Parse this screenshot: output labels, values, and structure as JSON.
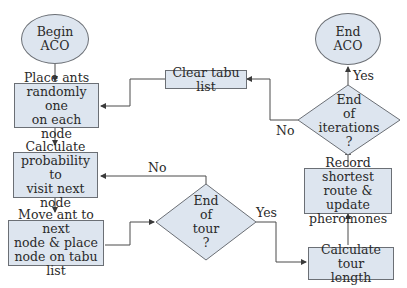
{
  "nodes": {
    "begin": {
      "line1": "Begin",
      "line2": "ACO"
    },
    "place_ants": {
      "line1": "Place ants",
      "line2": "randomly one",
      "line3": "on each node"
    },
    "calc_prob": {
      "line1": "Calculate",
      "line2": "probability to",
      "line3": "visit next node"
    },
    "move_ant": {
      "line1": "Move ant to next",
      "line2": "node & place",
      "line3": "node on tabu list"
    },
    "end_tour": {
      "line1": "End",
      "line2": "of",
      "line3": "tour",
      "line4": "?"
    },
    "calc_length": {
      "line1": "Calculate tour",
      "line2": "length"
    },
    "record": {
      "line1": "Record shortest",
      "line2": "route & update",
      "line3": "pheromones"
    },
    "end_iter": {
      "line1": "End",
      "line2": "of",
      "line3": "iterations",
      "line4": "?"
    },
    "clear_tabu": {
      "line1": "Clear tabu list"
    },
    "end": {
      "line1": "End",
      "line2": "ACO"
    }
  },
  "labels": {
    "tour_no": "No",
    "tour_yes": "Yes",
    "iter_no": "No",
    "iter_yes": "Yes"
  },
  "colors": {
    "fill": "#dde5ef",
    "stroke": "#6b6f75",
    "line": "#4a4a4a"
  }
}
